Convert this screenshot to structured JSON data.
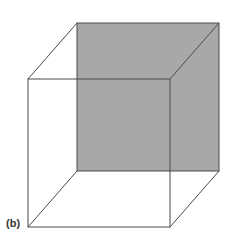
{
  "figure": {
    "label": "(b)",
    "type": "Necker cube (wireframe) with shaded back face",
    "colors": {
      "background": "#ffffff",
      "back_face_fill": "#a8a8a8",
      "edge_stroke": "#4a4a4a"
    },
    "back_face": {
      "x1": 77,
      "y1": 23,
      "x2": 219,
      "y2": 171
    },
    "front_face": {
      "x1": 28,
      "y1": 79,
      "x2": 170,
      "y2": 227
    }
  }
}
